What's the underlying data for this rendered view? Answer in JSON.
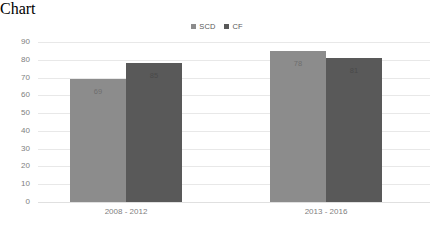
{
  "chart_data": {
    "type": "bar",
    "title": "",
    "subtitle": "",
    "xlabel": "",
    "ylabel": "",
    "categories": [
      "2008 - 2012",
      "2013 - 2016"
    ],
    "series": [
      {
        "name": "SCD",
        "color": "#8c8c8c",
        "values": [
          69,
          85
        ]
      },
      {
        "name": "CF",
        "color": "#595959",
        "values": [
          78,
          81
        ]
      }
    ],
    "ylim": [
      0,
      90
    ],
    "yticks": [
      0,
      10,
      20,
      30,
      40,
      50,
      60,
      70,
      80,
      90
    ],
    "ytick_labels": [
      "0",
      "10",
      "20",
      "30",
      "40",
      "50",
      "60",
      "70",
      "80",
      "90"
    ],
    "grid": true,
    "grid_color": "#e8e8e8",
    "legend_position": "top-center",
    "data_labels": true,
    "data_label_values": [
      [
        "69",
        "78"
      ],
      [
        "85",
        "81"
      ]
    ],
    "background": "#ffffff",
    "axis_text_color": "#808080"
  },
  "legend": {
    "items": [
      {
        "label": "SCD",
        "color": "#8c8c8c"
      },
      {
        "label": "CF",
        "color": "#595959"
      }
    ]
  }
}
